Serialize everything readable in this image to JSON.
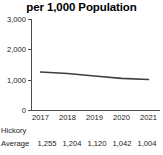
{
  "chart_data": {
    "type": "line",
    "title": "per 1,000 Population",
    "xlabel": "",
    "ylabel": "",
    "categories": [
      "2017",
      "2018",
      "2019",
      "2020",
      "2021"
    ],
    "series": [
      {
        "name": "Hickory Average",
        "values": [
          1255,
          1204,
          1120,
          1042,
          1004
        ],
        "value_labels": [
          "1,255",
          "1,204",
          "1,120",
          "1,042",
          "1,004"
        ],
        "color": "#3f3f3f"
      }
    ],
    "ylim": [
      0,
      3000
    ],
    "ytick_values": [
      0,
      1000,
      2000,
      3000
    ],
    "ytick_labels": [
      "0",
      "1,000",
      "2,000",
      "3,000"
    ],
    "grid": false,
    "legend": "none"
  },
  "table": {
    "row_label_line1": "Hickory",
    "row_label_line2": "Average"
  },
  "colors": {
    "axis": "#4d4d4d",
    "series": "#3f3f3f",
    "text": "#1a1a1a",
    "background": "#ffffff"
  }
}
